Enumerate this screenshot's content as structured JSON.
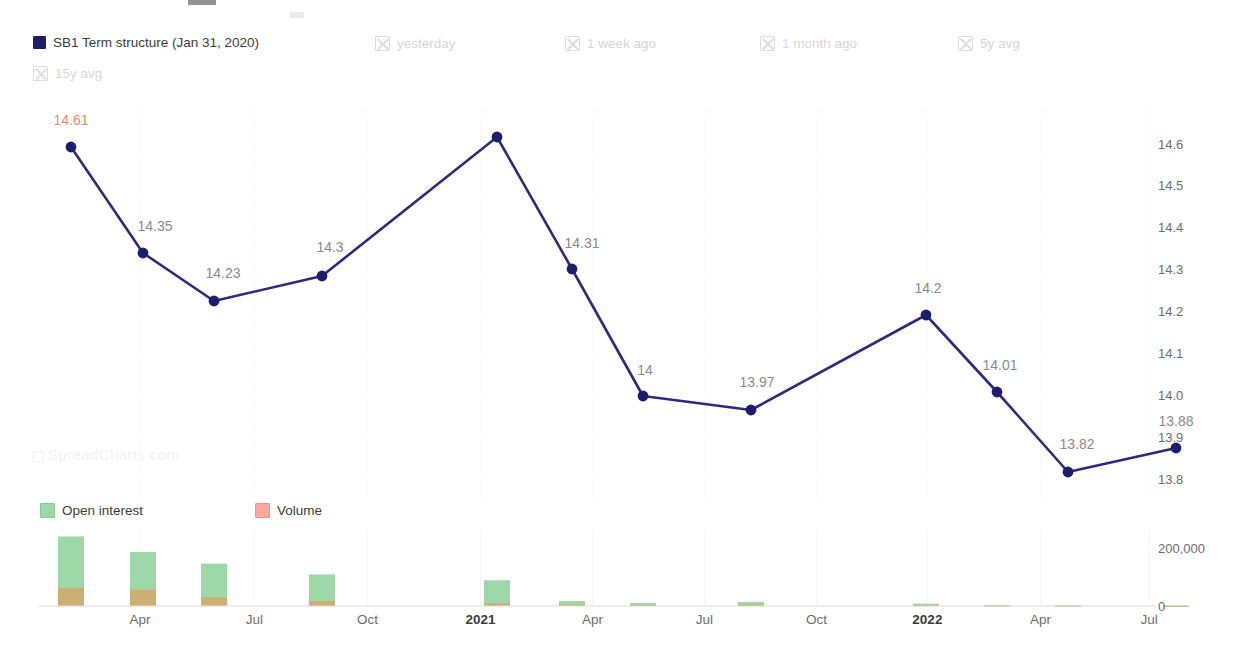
{
  "legend": {
    "series": [
      {
        "label": "SB1 Term structure (Jan 31, 2020)",
        "state": "active",
        "swatch": "solid",
        "color": "#1d1d6b",
        "x": 33
      },
      {
        "label": "yesterday",
        "state": "muted",
        "swatch": "off",
        "x": 375
      },
      {
        "label": "1 week ago",
        "state": "muted",
        "swatch": "off",
        "x": 565
      },
      {
        "label": "1 month ago",
        "state": "muted",
        "swatch": "off",
        "x": 760
      },
      {
        "label": "5y avg",
        "state": "muted",
        "swatch": "off",
        "x": 958
      },
      {
        "label": "15y avg",
        "state": "muted",
        "swatch": "off",
        "x": 33,
        "row": 1
      }
    ],
    "bars": [
      {
        "label": "Open interest",
        "swatch": "oi",
        "color": "#9ed8a8",
        "x": 40
      },
      {
        "label": "Volume",
        "swatch": "vol",
        "color": "#fba9a0",
        "x": 255
      }
    ]
  },
  "watermark": "SpreadCharts.com",
  "chart_data": {
    "type": "line",
    "title": "",
    "xlabel": "",
    "ylabel": "",
    "grid": true,
    "legend_position": "top",
    "ylim": [
      13.75,
      14.68
    ],
    "yticks": [
      14.6,
      14.5,
      14.4,
      14.3,
      14.2,
      14.1,
      14.0,
      13.9,
      13.8
    ],
    "ytick_labels": [
      "14.6",
      "14.5",
      "14.4",
      "14.3",
      "14.2",
      "14.1",
      "14.0",
      "13.9",
      "13.8"
    ],
    "x": [
      "2020-02",
      "2020-04",
      "2020-06",
      "2020-09",
      "2021-01",
      "2021-03",
      "2021-06",
      "2021-09",
      "2022-01",
      "2022-03",
      "2022-06",
      "2022-09"
    ],
    "xticks": [
      {
        "label": "Apr",
        "pos": 0.093,
        "bold": false
      },
      {
        "label": "Jul",
        "pos": 0.197,
        "bold": false
      },
      {
        "label": "Oct",
        "pos": 0.3,
        "bold": false
      },
      {
        "label": "2021",
        "pos": 0.403,
        "bold": true
      },
      {
        "label": "Apr",
        "pos": 0.505,
        "bold": false
      },
      {
        "label": "Jul",
        "pos": 0.607,
        "bold": false
      },
      {
        "label": "Oct",
        "pos": 0.709,
        "bold": false
      },
      {
        "label": "2022",
        "pos": 0.81,
        "bold": true
      },
      {
        "label": "Apr",
        "pos": 0.913,
        "bold": false
      },
      {
        "label": "Jul",
        "pos": 1.012,
        "bold": false
      }
    ],
    "series": [
      {
        "name": "SB1 Term structure (Jan 31, 2020)",
        "color": "#2b2b7a",
        "values": [
          14.61,
          14.35,
          14.23,
          14.3,
          14.65,
          14.31,
          14.0,
          13.97,
          14.2,
          14.01,
          13.82,
          13.88
        ],
        "labels": [
          "14.61",
          "14.35",
          "14.23",
          "14.3",
          "",
          "14.31",
          "14",
          "13.97",
          "14.2",
          "14.01",
          "13.82",
          "13.88"
        ]
      }
    ],
    "points": [
      {
        "px": 71,
        "py": 147,
        "label": "14.61",
        "lx": 71,
        "ly": 128,
        "first": true
      },
      {
        "px": 143,
        "py": 253,
        "label": "14.35",
        "lx": 155,
        "ly": 234,
        "first": false
      },
      {
        "px": 214,
        "py": 301,
        "label": "14.23",
        "lx": 223,
        "ly": 281,
        "first": false
      },
      {
        "px": 322,
        "py": 276,
        "label": "14.3",
        "lx": 330,
        "ly": 255,
        "first": false
      },
      {
        "px": 497,
        "py": 137,
        "label": "",
        "lx": 497,
        "ly": 120,
        "first": false
      },
      {
        "px": 572,
        "py": 269,
        "label": "14.31",
        "lx": 582,
        "ly": 251,
        "first": false
      },
      {
        "px": 643,
        "py": 396,
        "label": "14",
        "lx": 645,
        "ly": 378,
        "first": false
      },
      {
        "px": 751,
        "py": 410,
        "label": "13.97",
        "lx": 757,
        "ly": 390,
        "first": false
      },
      {
        "px": 926,
        "py": 315,
        "label": "14.2",
        "lx": 928,
        "ly": 296,
        "first": false
      },
      {
        "px": 997,
        "py": 392,
        "label": "14.01",
        "lx": 1000,
        "ly": 373,
        "first": false
      },
      {
        "px": 1068,
        "py": 472,
        "label": "13.82",
        "lx": 1077,
        "ly": 452,
        "first": false
      },
      {
        "px": 1176,
        "py": 448,
        "label": "13.88",
        "lx": 1176,
        "ly": 429,
        "first": false
      }
    ],
    "secondary": {
      "type": "bar",
      "ylim": [
        0,
        260000
      ],
      "yticks": [
        200000,
        0
      ],
      "ytick_labels": [
        "200,000",
        "0"
      ],
      "series": [
        {
          "name": "Open interest",
          "color": "#9ed8a8",
          "values": [
            238000,
            185000,
            145000,
            108000,
            88000,
            17000,
            10000,
            14000,
            8000,
            3000,
            2000,
            1500
          ]
        },
        {
          "name": "Volume",
          "color": "#fba9a0",
          "values": [
            62000,
            56000,
            30000,
            17000,
            9000,
            5000,
            4000,
            5000,
            3000,
            1500,
            1000,
            800
          ]
        }
      ],
      "bar_px": [
        {
          "cx": 71,
          "oi": 238000,
          "vol": 62000
        },
        {
          "cx": 143,
          "oi": 185000,
          "vol": 56000
        },
        {
          "cx": 214,
          "oi": 145000,
          "vol": 30000
        },
        {
          "cx": 322,
          "oi": 108000,
          "vol": 17000
        },
        {
          "cx": 497,
          "oi": 88000,
          "vol": 9000
        },
        {
          "cx": 572,
          "oi": 17000,
          "vol": 5000
        },
        {
          "cx": 643,
          "oi": 10000,
          "vol": 4000
        },
        {
          "cx": 751,
          "oi": 14000,
          "vol": 5000
        },
        {
          "cx": 926,
          "oi": 8000,
          "vol": 3000
        },
        {
          "cx": 997,
          "oi": 3000,
          "vol": 1500
        },
        {
          "cx": 1068,
          "oi": 2000,
          "vol": 1000
        },
        {
          "cx": 1176,
          "oi": 1500,
          "vol": 800
        }
      ]
    }
  }
}
